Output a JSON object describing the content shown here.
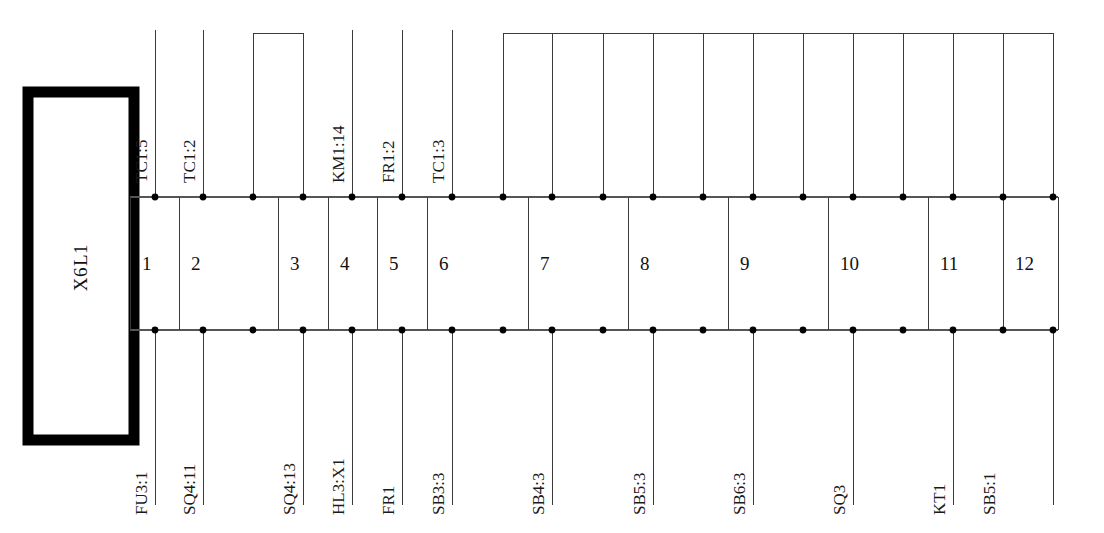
{
  "diagram": {
    "block": {
      "name": "terminal-block",
      "line1": "L1",
      "line2": "X6"
    },
    "geometry": {
      "rail_top_y": 197,
      "rail_bottom_y": 330,
      "rail_left_x": 130,
      "rail_right_x": 1058,
      "top_leader_y": 30,
      "bottom_leader_y": 505,
      "bridge_small_y": 33,
      "bridge_big_y": 33
    },
    "colors": {
      "line": "#3a3a3a",
      "rail": "#555555",
      "block_border": "#000000",
      "text": "#111111",
      "dot": "#000000"
    },
    "terminals": [
      {
        "num": "1",
        "left_x": 155,
        "right_x": 155,
        "cell_x0": 130,
        "cell_x1": 179,
        "top_label": "TC1:5",
        "bottom_label": "FU3:1"
      },
      {
        "num": "2",
        "left_x": 203,
        "right_x": 253,
        "cell_x0": 179,
        "cell_x1": 278,
        "top_label": "TC1:2",
        "bottom_label": "SQ4:11"
      },
      {
        "num": "3",
        "left_x": 303,
        "right_x": 303,
        "cell_x0": 278,
        "cell_x1": 328,
        "top_label": "",
        "bottom_label": "SQ4:13"
      },
      {
        "num": "4",
        "left_x": 352,
        "right_x": 352,
        "cell_x0": 328,
        "cell_x1": 377,
        "top_label": "KM1:14",
        "bottom_label": "HL3:X1"
      },
      {
        "num": "5",
        "left_x": 402,
        "right_x": 402,
        "cell_x0": 377,
        "cell_x1": 427,
        "top_label": "FR1:2",
        "bottom_label": "FR1"
      },
      {
        "num": "6",
        "left_x": 452,
        "right_x": 503,
        "cell_x0": 427,
        "cell_x1": 528,
        "top_label": "TC1:3",
        "bottom_label": "SB3:3"
      },
      {
        "num": "7",
        "left_x": 552,
        "right_x": 603,
        "cell_x0": 528,
        "cell_x1": 628,
        "top_label": "",
        "bottom_label": "SB4:3"
      },
      {
        "num": "8",
        "left_x": 653,
        "right_x": 703,
        "cell_x0": 628,
        "cell_x1": 728,
        "top_label": "",
        "bottom_label": "SB5:3"
      },
      {
        "num": "9",
        "left_x": 753,
        "right_x": 803,
        "cell_x0": 728,
        "cell_x1": 828,
        "top_label": "",
        "bottom_label": "SB6:3"
      },
      {
        "num": "10",
        "left_x": 853,
        "right_x": 903,
        "cell_x0": 828,
        "cell_x1": 928,
        "top_label": "",
        "bottom_label": "SQ3"
      },
      {
        "num": "11",
        "left_x": 953,
        "right_x": 978,
        "cell_x0": 928,
        "cell_x1": 1003,
        "top_label": "",
        "bottom_label": "KT1"
      },
      {
        "num": "12",
        "left_x": 1003,
        "right_x": 1053,
        "cell_x0": 1003,
        "cell_x1": 1058,
        "top_label": "",
        "bottom_label": "SB5:1"
      }
    ],
    "top_dots_x": [
      155,
      203,
      253,
      303,
      352,
      402,
      452,
      503,
      552,
      603,
      653,
      703,
      753,
      803,
      853,
      903,
      953,
      1003,
      1053
    ],
    "bottom_dots_x": [
      155,
      203,
      253,
      303,
      352,
      402,
      452,
      503,
      552,
      603,
      653,
      703,
      753,
      803,
      853,
      903,
      953,
      1003,
      1053
    ],
    "top_leaders_x": [
      155,
      203,
      352,
      402,
      452
    ],
    "bottom_leaders_x": [
      155,
      203,
      303,
      352,
      402,
      452,
      552,
      653,
      753,
      853,
      953,
      1053
    ],
    "bridges": [
      {
        "name": "bridge-small",
        "x_start": 253,
        "x_end": 303,
        "pins": [
          253,
          303
        ],
        "top_y": 33
      },
      {
        "name": "bridge-bus",
        "x_start": 503,
        "x_end": 1053,
        "pins": [
          503,
          552,
          603,
          653,
          703,
          753,
          803,
          853,
          903,
          953,
          1003,
          1053
        ],
        "top_y": 33
      }
    ]
  }
}
